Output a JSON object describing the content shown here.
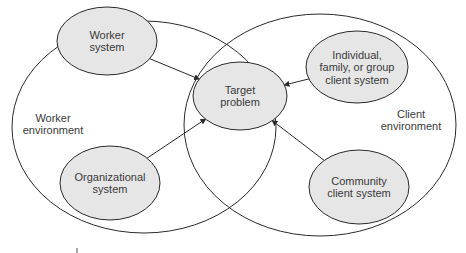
{
  "environments": [
    {
      "id": "worker-env",
      "lines": [
        "Worker",
        "environment"
      ]
    },
    {
      "id": "client-env",
      "lines": [
        "Client",
        "environment"
      ]
    }
  ],
  "nodes": [
    {
      "id": "worker-system",
      "lines": [
        "Worker",
        "system"
      ]
    },
    {
      "id": "organizational-system",
      "lines": [
        "Organizational",
        "system"
      ]
    },
    {
      "id": "target-problem",
      "lines": [
        "Target",
        "problem"
      ]
    },
    {
      "id": "individual-client-system",
      "lines": [
        "Individual,",
        "family, or group",
        "client system"
      ]
    },
    {
      "id": "community-client-system",
      "lines": [
        "Community",
        "client system"
      ]
    }
  ],
  "edges": [
    {
      "from": "worker-system",
      "to": "target-problem"
    },
    {
      "from": "organizational-system",
      "to": "target-problem"
    },
    {
      "from": "individual-client-system",
      "to": "target-problem"
    },
    {
      "from": "community-client-system",
      "to": "target-problem"
    }
  ],
  "colors": {
    "node_fill": "#e6e6e6",
    "stroke": "#2a2a2a",
    "text": "#3a3a3a"
  }
}
